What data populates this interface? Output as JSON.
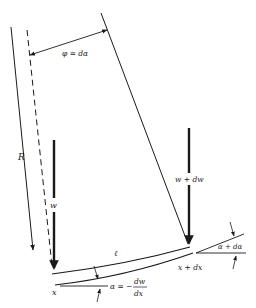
{
  "diagram": {
    "type": "beam-element-geometry",
    "labels": {
      "angle_phi": "φ = dα",
      "radius": "R",
      "load_left": "w",
      "load_right": "w + dw",
      "length": "ℓ",
      "pos_left": "x",
      "pos_right": "x + dx",
      "slope_left_prefix": "α = −",
      "slope_left_num": "dw",
      "slope_left_den": "dx",
      "slope_right": "α + dα"
    },
    "colors": {
      "stroke": "#1a1a1a",
      "background": "#ffffff"
    }
  }
}
